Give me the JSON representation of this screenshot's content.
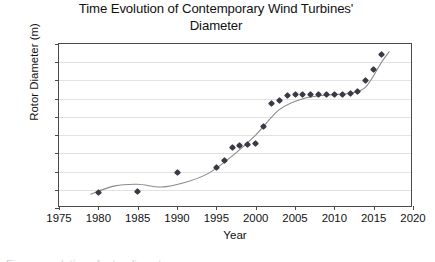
{
  "chart_data": {
    "type": "scatter",
    "title": "Time Evolution of Contemporary Wind Turbines' Diameter",
    "title_line1": "Time Evolution of Contemporary Wind Turbines'",
    "title_line2": "Diameter",
    "xlabel": "Year",
    "ylabel": "Rotor Diameter (m)",
    "xlim": [
      1975,
      2020
    ],
    "ylim": [
      0,
      180
    ],
    "xticks": [
      1975,
      1980,
      1985,
      1990,
      1995,
      2000,
      2005,
      2010,
      2015,
      2020
    ],
    "yticks": [
      0,
      20,
      40,
      60,
      80,
      100,
      120,
      140,
      160,
      180
    ],
    "grid": "horizontal",
    "legend": "none",
    "trendline": true,
    "marker_color": "#3a3a46",
    "trendline_color": "#8a8a8a",
    "grid_color": "#e2e2e2",
    "axis_color": "#4a4a4a",
    "series": [
      {
        "name": "Rotor diameter",
        "x": [
          1980,
          1985,
          1990,
          1995,
          1996,
          1997,
          1998,
          1999,
          2000,
          2001,
          2002,
          2003,
          2004,
          2005,
          2006,
          2007,
          2008,
          2009,
          2010,
          2011,
          2012,
          2013,
          2014,
          2015,
          2016
        ],
        "values": [
          17,
          18,
          39,
          44,
          52,
          66,
          69,
          70,
          71,
          90,
          115,
          118,
          124,
          125,
          125,
          125,
          125,
          125,
          125,
          125,
          126,
          128,
          140,
          152,
          169
        ]
      }
    ]
  },
  "caption": {
    "clipped_text": "Figure: evolution of rotor diameter"
  }
}
